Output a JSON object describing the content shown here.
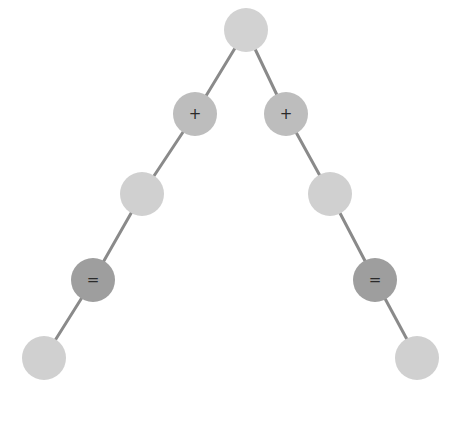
{
  "diagram": {
    "type": "tree",
    "width": 459,
    "height": 421,
    "edge_color": "#8a8a8a",
    "edge_width": 3,
    "styles": {
      "root": {
        "fill": "#d2d2d2",
        "radius": 22
      },
      "operator_plus": {
        "fill": "#bdbdbd",
        "radius": 22
      },
      "light": {
        "fill": "#d0d0d0",
        "radius": 22
      },
      "operator_equals": {
        "fill": "#9e9e9e",
        "radius": 22
      }
    },
    "nodes": [
      {
        "id": "root",
        "label": "",
        "x": 246,
        "y": 30,
        "style": "root"
      },
      {
        "id": "plus-left",
        "label": "+",
        "x": 195,
        "y": 114,
        "style": "operator_plus"
      },
      {
        "id": "plus-right",
        "label": "+",
        "x": 286,
        "y": 114,
        "style": "operator_plus"
      },
      {
        "id": "mid-left",
        "label": "",
        "x": 142,
        "y": 194,
        "style": "light"
      },
      {
        "id": "mid-right",
        "label": "",
        "x": 330,
        "y": 194,
        "style": "light"
      },
      {
        "id": "eq-left",
        "label": "=",
        "x": 93,
        "y": 280,
        "style": "operator_equals"
      },
      {
        "id": "eq-right",
        "label": "=",
        "x": 375,
        "y": 280,
        "style": "operator_equals"
      },
      {
        "id": "leaf-left",
        "label": "",
        "x": 44,
        "y": 358,
        "style": "light"
      },
      {
        "id": "leaf-right",
        "label": "",
        "x": 417,
        "y": 358,
        "style": "light"
      }
    ],
    "edges": [
      {
        "from": "root",
        "to": "plus-left"
      },
      {
        "from": "root",
        "to": "plus-right"
      },
      {
        "from": "plus-left",
        "to": "mid-left"
      },
      {
        "from": "plus-right",
        "to": "mid-right"
      },
      {
        "from": "mid-left",
        "to": "eq-left"
      },
      {
        "from": "mid-right",
        "to": "eq-right"
      },
      {
        "from": "eq-left",
        "to": "leaf-left"
      },
      {
        "from": "eq-right",
        "to": "leaf-right"
      }
    ]
  }
}
